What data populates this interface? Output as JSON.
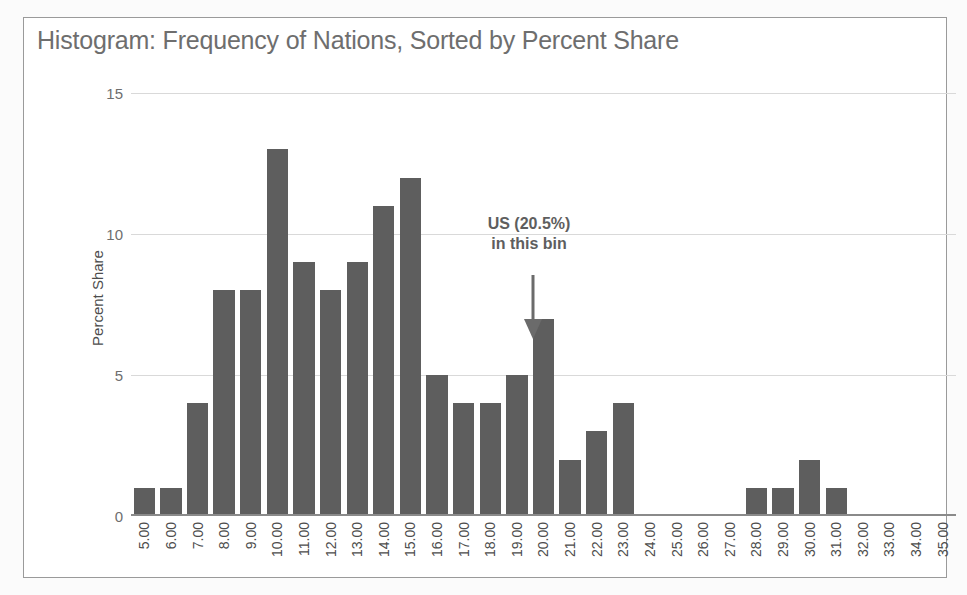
{
  "chart_data": {
    "type": "bar",
    "title": "Histogram: Frequency of Nations, Sorted by Percent Share",
    "xlabel": "",
    "ylabel": "Percent Share",
    "ylim": [
      0,
      15
    ],
    "yticks": [
      0,
      5,
      10,
      15
    ],
    "ytick_labels": [
      "0",
      "5",
      "10",
      "15"
    ],
    "grid": true,
    "legend": null,
    "bar_color": "#5e5e5e",
    "gridline_color": "#d9d9d9",
    "title_color": "#6e6e6e",
    "categories": [
      "5.00",
      "6.00",
      "7.00",
      "8.00",
      "9.00",
      "10.00",
      "11.00",
      "12.00",
      "13.00",
      "14.00",
      "15.00",
      "16.00",
      "17.00",
      "18.00",
      "19.00",
      "20.00",
      "21.00",
      "22.00",
      "23.00",
      "24.00",
      "25.00",
      "26.00",
      "27.00",
      "28.00",
      "29.00",
      "30.00",
      "31.00",
      "32.00",
      "33.00",
      "34.00",
      "35.00"
    ],
    "values": [
      1,
      1,
      4,
      8,
      8,
      13,
      9,
      8,
      9,
      11,
      12,
      5,
      4,
      4,
      5,
      7,
      2,
      3,
      4,
      0,
      0,
      0,
      0,
      1,
      1,
      2,
      1,
      0,
      0,
      0,
      0
    ],
    "annotations": [
      {
        "name": "us-bin-callout",
        "line1": "US (20.5%)",
        "line2": "in this bin",
        "points_to_category": "20.00",
        "arrow": "down-arrow"
      }
    ]
  }
}
